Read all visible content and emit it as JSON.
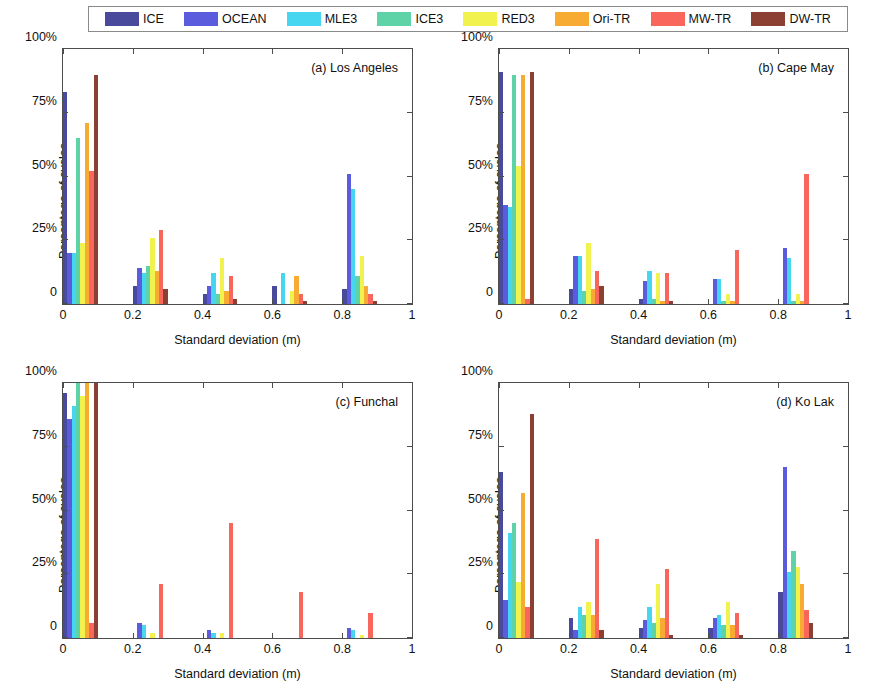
{
  "legend": {
    "position": "top-center",
    "entries": [
      {
        "label": "ICE",
        "color": "#4a4a9c"
      },
      {
        "label": "OCEAN",
        "color": "#5b5bdd"
      },
      {
        "label": "MLE3",
        "color": "#46d6f0"
      },
      {
        "label": "ICE3",
        "color": "#5fd3a8"
      },
      {
        "label": "RED3",
        "color": "#f2f24f"
      },
      {
        "label": "Ori-TR",
        "color": "#f8ab32"
      },
      {
        "label": "MW-TR",
        "color": "#f9675c"
      },
      {
        "label": "DW-TR",
        "color": "#8c4033"
      }
    ]
  },
  "axes": {
    "xlabel": "Standard deviation (m)",
    "ylabel": "Percentage of cycles",
    "xticks": [
      "0",
      "0.2",
      "0.4",
      "0.6",
      "0.8",
      "1"
    ],
    "xtick_values": [
      0,
      0.2,
      0.4,
      0.6,
      0.8,
      1
    ],
    "yticks": [
      "0",
      "25%",
      "50%",
      "75%",
      "100%"
    ],
    "ytick_values": [
      0,
      25,
      50,
      75,
      100
    ],
    "xlim": [
      0,
      1
    ],
    "ylim": [
      0,
      100
    ],
    "grid": false
  },
  "panels": [
    {
      "id": "a",
      "caption": "(a) Los Angeles"
    },
    {
      "id": "b",
      "caption": "(b) Cape May"
    },
    {
      "id": "c",
      "caption": "(c) Funchal"
    },
    {
      "id": "d",
      "caption": "(d) Ko Lak"
    }
  ],
  "chart_data": [
    {
      "type": "bar",
      "title": "(a) Los Angeles",
      "xlabel": "Standard deviation (m)",
      "ylabel": "Percentage of cycles",
      "xlim": [
        0,
        1
      ],
      "ylim": [
        0,
        100
      ],
      "grid": false,
      "legend_position": "top-center",
      "categories": [
        "0.0-0.1",
        "0.1-0.2",
        "0.2-0.3",
        "0.3-0.4",
        "0.4-0.5",
        "0.5-0.6",
        "0.6-0.7",
        "0.7-0.8",
        "0.8-0.9",
        "0.9-1.0"
      ],
      "bin_centers": [
        0.05,
        0.15,
        0.25,
        0.35,
        0.45,
        0.55,
        0.65,
        0.75,
        0.85,
        0.95
      ],
      "series": [
        {
          "name": "ICE",
          "color": "#4a4a9c",
          "values": [
            83,
            0,
            7,
            0,
            4,
            0,
            7,
            0,
            6,
            0
          ]
        },
        {
          "name": "OCEAN",
          "color": "#5b5bdd",
          "values": [
            20,
            0,
            14,
            0,
            7,
            0,
            0,
            0,
            51,
            0
          ]
        },
        {
          "name": "MLE3",
          "color": "#46d6f0",
          "values": [
            20,
            0,
            12,
            0,
            12,
            0,
            12,
            0,
            45,
            0
          ]
        },
        {
          "name": "ICE3",
          "color": "#5fd3a8",
          "values": [
            65,
            0,
            15,
            0,
            4,
            0,
            0,
            0,
            11,
            0
          ]
        },
        {
          "name": "RED3",
          "color": "#f2f24f",
          "values": [
            24,
            0,
            26,
            0,
            18,
            0,
            5,
            0,
            19,
            0
          ]
        },
        {
          "name": "Ori-TR",
          "color": "#f8ab32",
          "values": [
            71,
            0,
            13,
            0,
            5,
            0,
            11,
            0,
            7,
            0
          ]
        },
        {
          "name": "MW-TR",
          "color": "#f9675c",
          "values": [
            52,
            0,
            29,
            0,
            11,
            0,
            4,
            0,
            4,
            0
          ]
        },
        {
          "name": "DW-TR",
          "color": "#8c4033",
          "values": [
            90,
            0,
            6,
            0,
            2,
            0,
            1,
            0,
            1,
            0
          ]
        }
      ]
    },
    {
      "type": "bar",
      "title": "(b) Cape May",
      "xlabel": "Standard deviation (m)",
      "ylabel": "Percentage of cycles",
      "xlim": [
        0,
        1
      ],
      "ylim": [
        0,
        100
      ],
      "grid": false,
      "legend_position": "top-center",
      "categories": [
        "0.0-0.1",
        "0.1-0.2",
        "0.2-0.3",
        "0.3-0.4",
        "0.4-0.5",
        "0.5-0.6",
        "0.6-0.7",
        "0.7-0.8",
        "0.8-0.9",
        "0.9-1.0"
      ],
      "bin_centers": [
        0.05,
        0.15,
        0.25,
        0.35,
        0.45,
        0.55,
        0.65,
        0.75,
        0.85,
        0.95
      ],
      "series": [
        {
          "name": "ICE",
          "color": "#4a4a9c",
          "values": [
            91,
            0,
            6,
            0,
            2,
            0,
            0,
            0,
            0,
            0
          ]
        },
        {
          "name": "OCEAN",
          "color": "#5b5bdd",
          "values": [
            39,
            0,
            19,
            0,
            9,
            0,
            10,
            0,
            22,
            0
          ]
        },
        {
          "name": "MLE3",
          "color": "#46d6f0",
          "values": [
            38,
            0,
            19,
            0,
            13,
            0,
            10,
            0,
            18,
            0
          ]
        },
        {
          "name": "ICE3",
          "color": "#5fd3a8",
          "values": [
            90,
            0,
            5,
            0,
            2,
            0,
            1,
            0,
            1,
            0
          ]
        },
        {
          "name": "RED3",
          "color": "#f2f24f",
          "values": [
            54,
            0,
            24,
            0,
            12,
            0,
            4,
            0,
            4,
            0
          ]
        },
        {
          "name": "Ori-TR",
          "color": "#f8ab32",
          "values": [
            90,
            0,
            6,
            0,
            1,
            0,
            1,
            0,
            1,
            0
          ]
        },
        {
          "name": "MW-TR",
          "color": "#f9675c",
          "values": [
            2,
            0,
            13,
            0,
            12,
            0,
            21,
            0,
            51,
            0
          ]
        },
        {
          "name": "DW-TR",
          "color": "#8c4033",
          "values": [
            91,
            0,
            7,
            0,
            1,
            0,
            0,
            0,
            0,
            0
          ]
        }
      ]
    },
    {
      "type": "bar",
      "title": "(c) Funchal",
      "xlabel": "Standard deviation (m)",
      "ylabel": "Percentage of cycles",
      "xlim": [
        0,
        1
      ],
      "ylim": [
        0,
        100
      ],
      "grid": false,
      "legend_position": "top-center",
      "categories": [
        "0.0-0.1",
        "0.1-0.2",
        "0.2-0.3",
        "0.3-0.4",
        "0.4-0.5",
        "0.5-0.6",
        "0.6-0.7",
        "0.7-0.8",
        "0.8-0.9",
        "0.9-1.0"
      ],
      "bin_centers": [
        0.05,
        0.15,
        0.25,
        0.35,
        0.45,
        0.55,
        0.65,
        0.75,
        0.85,
        0.95
      ],
      "series": [
        {
          "name": "ICE",
          "color": "#4a4a9c",
          "values": [
            96,
            0,
            0,
            0,
            0,
            0,
            0,
            0,
            0,
            0
          ]
        },
        {
          "name": "OCEAN",
          "color": "#5b5bdd",
          "values": [
            86,
            0,
            6,
            0,
            3,
            0,
            0,
            0,
            4,
            0
          ]
        },
        {
          "name": "MLE3",
          "color": "#46d6f0",
          "values": [
            91,
            0,
            5,
            0,
            2,
            0,
            0,
            0,
            3,
            0
          ]
        },
        {
          "name": "ICE3",
          "color": "#5fd3a8",
          "values": [
            100,
            0,
            0,
            0,
            0,
            0,
            0,
            0,
            0,
            0
          ]
        },
        {
          "name": "RED3",
          "color": "#f2f24f",
          "values": [
            95,
            0,
            2,
            0,
            2,
            0,
            0,
            0,
            1,
            0
          ]
        },
        {
          "name": "Ori-TR",
          "color": "#f8ab32",
          "values": [
            100,
            0,
            0,
            0,
            0,
            0,
            0,
            0,
            0,
            0
          ]
        },
        {
          "name": "MW-TR",
          "color": "#f9675c",
          "values": [
            6,
            0,
            21,
            0,
            45,
            0,
            18,
            0,
            10,
            0
          ]
        },
        {
          "name": "DW-TR",
          "color": "#8c4033",
          "values": [
            100,
            0,
            0,
            0,
            0,
            0,
            0,
            0,
            0,
            0
          ]
        }
      ]
    },
    {
      "type": "bar",
      "title": "(d) Ko Lak",
      "xlabel": "Standard deviation (m)",
      "ylabel": "Percentage of cycles",
      "xlim": [
        0,
        1
      ],
      "ylim": [
        0,
        100
      ],
      "grid": false,
      "legend_position": "top-center",
      "categories": [
        "0.0-0.1",
        "0.1-0.2",
        "0.2-0.3",
        "0.3-0.4",
        "0.4-0.5",
        "0.5-0.6",
        "0.6-0.7",
        "0.7-0.8",
        "0.8-0.9",
        "0.9-1.0"
      ],
      "bin_centers": [
        0.05,
        0.15,
        0.25,
        0.35,
        0.45,
        0.55,
        0.65,
        0.75,
        0.85,
        0.95
      ],
      "series": [
        {
          "name": "ICE",
          "color": "#4a4a9c",
          "values": [
            65,
            0,
            8,
            0,
            4,
            0,
            4,
            0,
            18,
            0
          ]
        },
        {
          "name": "OCEAN",
          "color": "#5b5bdd",
          "values": [
            15,
            0,
            3,
            0,
            7,
            0,
            8,
            0,
            67,
            0
          ]
        },
        {
          "name": "MLE3",
          "color": "#46d6f0",
          "values": [
            41,
            0,
            12,
            0,
            12,
            0,
            9,
            0,
            26,
            0
          ]
        },
        {
          "name": "ICE3",
          "color": "#5fd3a8",
          "values": [
            45,
            0,
            9,
            0,
            6,
            0,
            5,
            0,
            34,
            0
          ]
        },
        {
          "name": "RED3",
          "color": "#f2f24f",
          "values": [
            22,
            0,
            14,
            0,
            21,
            0,
            14,
            0,
            28,
            0
          ]
        },
        {
          "name": "Ori-TR",
          "color": "#f8ab32",
          "values": [
            57,
            0,
            9,
            0,
            8,
            0,
            5,
            0,
            21,
            0
          ]
        },
        {
          "name": "MW-TR",
          "color": "#f9675c",
          "values": [
            12,
            0,
            39,
            0,
            27,
            0,
            10,
            0,
            11,
            0
          ]
        },
        {
          "name": "DW-TR",
          "color": "#8c4033",
          "values": [
            88,
            0,
            3,
            0,
            1,
            0,
            1,
            0,
            6,
            0
          ]
        }
      ]
    }
  ]
}
